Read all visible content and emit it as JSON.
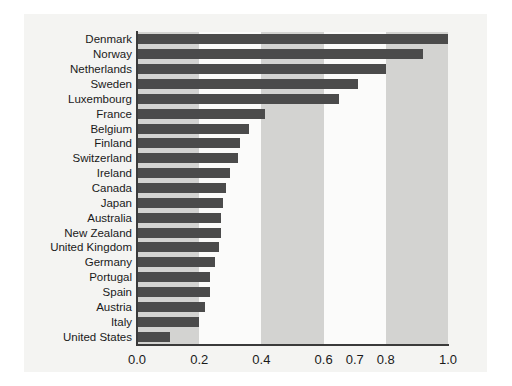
{
  "chart_data": {
    "type": "bar",
    "orientation": "horizontal",
    "title": "",
    "subtitle": "",
    "xlabel": "",
    "ylabel": "",
    "xlim": [
      0.0,
      1.0
    ],
    "grid": false,
    "legend": null,
    "tick_labels": [
      "0.0",
      "0.2",
      "0.4",
      "0.6",
      "0.7",
      "0.8",
      "1.0"
    ],
    "tick_values": [
      0.0,
      0.2,
      0.4,
      0.6,
      0.7,
      0.8,
      1.0
    ],
    "bands": [
      {
        "from": 0.0,
        "to": 0.2,
        "shade": "gray"
      },
      {
        "from": 0.2,
        "to": 0.4,
        "shade": "pale"
      },
      {
        "from": 0.4,
        "to": 0.6,
        "shade": "gray"
      },
      {
        "from": 0.6,
        "to": 0.7,
        "shade": "pale"
      },
      {
        "from": 0.7,
        "to": 0.8,
        "shade": "pale"
      },
      {
        "from": 0.8,
        "to": 1.0,
        "shade": "gray"
      }
    ],
    "bar_color": "#4b4b4b",
    "categories": [
      "Denmark",
      "Norway",
      "Netherlands",
      "Sweden",
      "Luxembourg",
      "France",
      "Belgium",
      "Finland",
      "Switzerland",
      "Ireland",
      "Canada",
      "Japan",
      "Australia",
      "New Zealand",
      "United Kingdom",
      "Germany",
      "Portugal",
      "Spain",
      "Austria",
      "Italy",
      "United States"
    ],
    "values": [
      1.0,
      0.92,
      0.8,
      0.71,
      0.65,
      0.41,
      0.36,
      0.33,
      0.325,
      0.3,
      0.285,
      0.275,
      0.27,
      0.27,
      0.265,
      0.25,
      0.235,
      0.235,
      0.22,
      0.2,
      0.105
    ]
  }
}
